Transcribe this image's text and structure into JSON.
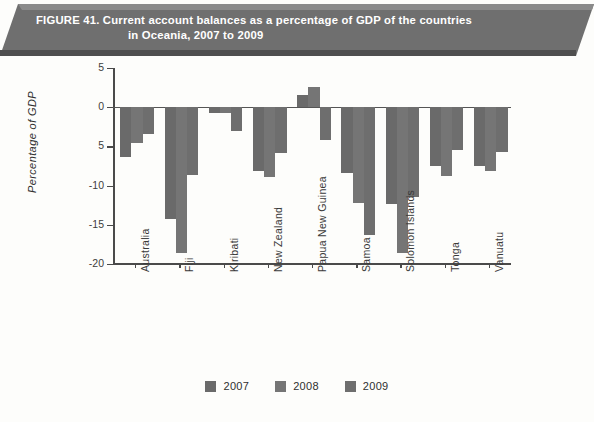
{
  "figure": {
    "title_line1": "FIGURE 41. Current account balances as a percentage of GDP of the countries",
    "title_line2": "in Oceania, 2007 to 2009",
    "banner_color": "#6f6f6f",
    "banner_text_color": "#ffffff"
  },
  "chart_data": {
    "type": "bar",
    "title": "FIGURE 41. Current account balances as a percentage of GDP of the countries in Oceania, 2007 to 2009",
    "xlabel": "",
    "ylabel": "Percentage of GDP",
    "ylim": [
      -20,
      5
    ],
    "yticks": [
      5,
      0,
      -5,
      -10,
      -15,
      -20
    ],
    "ytick_labels": [
      "5",
      "0",
      "5",
      "-10",
      "-15",
      "-20"
    ],
    "grid": false,
    "legend_position": "bottom",
    "categories": [
      "Australia",
      "Fiji",
      "Kiribati",
      "New Zealand",
      "Papua New Guinea",
      "Samoa",
      "Solomon Islands",
      "Tonga",
      "Vanuatu"
    ],
    "series": [
      {
        "name": "2007",
        "color": "#6a6a6a",
        "values": [
          -6.3,
          -14.3,
          -0.7,
          -8.2,
          1.5,
          -8.4,
          -12.3,
          -7.5,
          -7.5
        ]
      },
      {
        "name": "2008",
        "color": "#757575",
        "values": [
          -4.6,
          -18.6,
          -0.8,
          -8.9,
          2.6,
          -12.2,
          -18.6,
          -8.8,
          -8.1
        ]
      },
      {
        "name": "2009",
        "color": "#6e6e6e",
        "values": [
          -3.4,
          -8.6,
          -3.0,
          -5.9,
          -4.2,
          -16.3,
          -11.5,
          -5.5,
          -5.7
        ]
      }
    ]
  },
  "legend": {
    "items": [
      {
        "label": "2007",
        "color": "#6a6a6a"
      },
      {
        "label": "2008",
        "color": "#757575"
      },
      {
        "label": "2009",
        "color": "#6e6e6e"
      }
    ]
  }
}
